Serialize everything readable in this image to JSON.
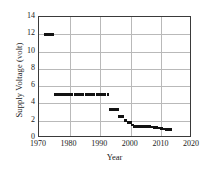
{
  "chart_data": {
    "type": "scatter",
    "title": "",
    "xlabel": "Year",
    "ylabel": "Supply Voltage (volt)",
    "xlim": [
      1970,
      2020
    ],
    "ylim": [
      0,
      14
    ],
    "xticks": [
      1970,
      1980,
      1990,
      2000,
      2010,
      2020
    ],
    "xtick_labels": [
      "1970",
      "1980",
      "1990",
      "2000",
      "2010",
      "2020"
    ],
    "yticks": [
      0,
      2,
      4,
      6,
      8,
      10,
      12,
      14
    ],
    "ytick_labels": [
      "0",
      "2",
      "4",
      "6",
      "8",
      "10",
      "12",
      "14"
    ],
    "grid": true,
    "legend": "none",
    "marker": "square",
    "marker_color": "#121212",
    "series": [
      {
        "name": "Supply Voltage",
        "points": [
          [
            1972.0,
            12.0
          ],
          [
            1972.8,
            12.0
          ],
          [
            1973.6,
            12.0
          ],
          [
            1974.4,
            12.0
          ],
          [
            1975.4,
            5.0
          ],
          [
            1976.3,
            5.0
          ],
          [
            1977.2,
            5.0
          ],
          [
            1978.1,
            5.0
          ],
          [
            1979.0,
            5.0
          ],
          [
            1979.9,
            5.0
          ],
          [
            1980.8,
            5.0
          ],
          [
            1981.7,
            5.0
          ],
          [
            1982.6,
            5.0
          ],
          [
            1983.5,
            5.0
          ],
          [
            1984.4,
            5.0
          ],
          [
            1985.3,
            5.0
          ],
          [
            1986.2,
            5.0
          ],
          [
            1987.1,
            5.0
          ],
          [
            1988.0,
            5.0
          ],
          [
            1988.9,
            5.0
          ],
          [
            1989.8,
            5.0
          ],
          [
            1990.7,
            5.0
          ],
          [
            1991.6,
            5.0
          ],
          [
            1992.5,
            5.0
          ],
          [
            1993.2,
            3.3
          ],
          [
            1994.0,
            3.3
          ],
          [
            1994.8,
            3.3
          ],
          [
            1995.6,
            3.3
          ],
          [
            1996.4,
            2.5
          ],
          [
            1997.2,
            2.5
          ],
          [
            1998.2,
            2.0
          ],
          [
            1999.2,
            1.8
          ],
          [
            1999.9,
            1.8
          ],
          [
            2000.6,
            1.5
          ],
          [
            2001.3,
            1.3
          ],
          [
            2002.1,
            1.3
          ],
          [
            2002.9,
            1.3
          ],
          [
            2003.7,
            1.3
          ],
          [
            2004.5,
            1.3
          ],
          [
            2005.3,
            1.3
          ],
          [
            2006.1,
            1.3
          ],
          [
            2006.9,
            1.25
          ],
          [
            2007.7,
            1.2
          ],
          [
            2008.5,
            1.2
          ],
          [
            2009.3,
            1.15
          ],
          [
            2010.1,
            1.1
          ],
          [
            2010.9,
            1.05
          ],
          [
            2011.7,
            1.0
          ],
          [
            2012.5,
            1.0
          ],
          [
            2013.2,
            1.0
          ]
        ]
      }
    ]
  }
}
